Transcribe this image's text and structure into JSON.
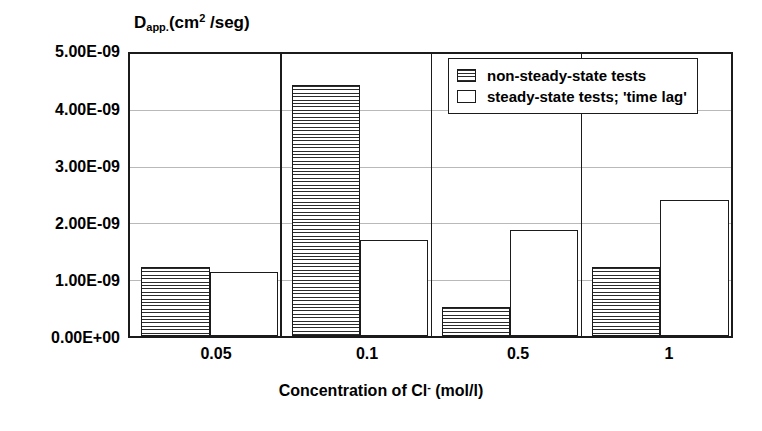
{
  "chart_data": {
    "type": "bar",
    "title": "",
    "ylabel": "Dapp.(cm2 /seg)",
    "ylabel_parts": {
      "base": "D",
      "sub": "app.",
      "mid": "(cm",
      "sup": "2",
      "tail": " /seg)"
    },
    "xlabel": "Concentration of Cl- (mol/l)",
    "xlabel_parts": {
      "lead": "Concentration of Cl",
      "sup": "-",
      "tail": "  (mol/l)"
    },
    "categories": [
      "0.05",
      "0.1",
      "0.5",
      "1"
    ],
    "series": [
      {
        "name": "non-steady-state tests",
        "fill": "striped",
        "values": [
          1.22e-09,
          4.45e-09,
          5.2e-10,
          1.22e-09
        ]
      },
      {
        "name": "steady-state tests; 'time lag'",
        "fill": "plain",
        "values": [
          1.13e-09,
          1.7e-09,
          1.88e-09,
          2.42e-09
        ]
      }
    ],
    "ylim": [
      0,
      5e-09
    ],
    "ytick_labels": [
      "5.00E-09",
      "4.00E-09",
      "3.00E-09",
      "2.00E-09",
      "1.00E-09",
      "0.00E+00"
    ],
    "ytick_values": [
      5e-09,
      4e-09,
      3e-09,
      2e-09,
      1e-09,
      0
    ],
    "grid": true,
    "grid_axis": "y",
    "legend_position": "top-right",
    "colors": {
      "outline": "#1b1b1b",
      "grid": "#b9b9b9",
      "background": "#ffffff"
    }
  },
  "legend": {
    "items": [
      {
        "label": "non-steady-state tests",
        "swatch": "striped"
      },
      {
        "label": "steady-state tests; 'time lag'",
        "swatch": "plain"
      }
    ]
  }
}
